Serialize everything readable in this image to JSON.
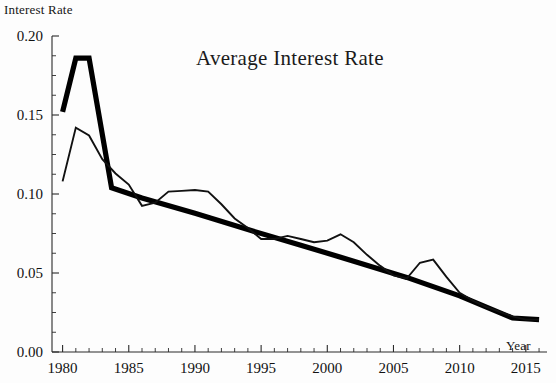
{
  "chart_data": {
    "type": "line",
    "title": "Average Interest Rate",
    "xlabel": "Year",
    "ylabel": "Interest Rate",
    "xlim": [
      1979.2,
      1916.0
    ],
    "x_axis_range": [
      1979.2,
      2016.6
    ],
    "ylim": [
      0.0,
      0.205
    ],
    "grid": false,
    "legend": "none",
    "xticks": [
      1980,
      1985,
      1990,
      1995,
      2000,
      2005,
      2010,
      2015
    ],
    "xticklabels": [
      "1980",
      "1985",
      "1990",
      "1995",
      "2000",
      "2005",
      "2010",
      "2015"
    ],
    "x_minor_tick_step": 1,
    "yticks": [
      0.0,
      0.05,
      0.1,
      0.15,
      0.2
    ],
    "yticklabels": [
      "0.00",
      "0.05",
      "0.10",
      "0.15",
      "0.20"
    ],
    "y_minor_tick_step": 0.0125,
    "series": [
      {
        "name": "thick-trend",
        "color": "#000000",
        "linewidth": 5.2,
        "x": [
          1980,
          1981,
          1982,
          1983.7,
          1986,
          1990,
          1994,
          1998,
          2002,
          2006,
          2010,
          2014,
          2016
        ],
        "values": [
          0.152,
          0.186,
          0.186,
          0.104,
          0.0975,
          0.0878,
          0.0775,
          0.0676,
          0.0575,
          0.0472,
          0.0355,
          0.0215,
          0.0205
        ]
      },
      {
        "name": "actual-rate",
        "color": "#111111",
        "linewidth": 1.9,
        "x": [
          1980,
          1981,
          1982,
          1983,
          1984,
          1985,
          1986,
          1987,
          1988,
          1989,
          1990,
          1991,
          1992,
          1993,
          1994,
          1995,
          1996,
          1997,
          1998,
          1999,
          2000,
          2001,
          2002,
          2003,
          2004,
          2005,
          2006,
          2007,
          2008,
          2009,
          2010,
          2011,
          2012,
          2013,
          2014,
          2015,
          2016
        ],
        "values": [
          0.108,
          0.142,
          0.137,
          0.122,
          0.113,
          0.106,
          0.0925,
          0.0945,
          0.1015,
          0.102,
          0.1025,
          0.1015,
          0.0935,
          0.0845,
          0.0785,
          0.0715,
          0.0715,
          0.0735,
          0.0715,
          0.0695,
          0.0705,
          0.0745,
          0.0695,
          0.0615,
          0.0545,
          0.0485,
          0.0465,
          0.0565,
          0.0585,
          0.0475,
          0.0375,
          0.0325,
          0.0285,
          0.0255,
          0.0225,
          0.0205,
          0.0205
        ]
      }
    ]
  }
}
